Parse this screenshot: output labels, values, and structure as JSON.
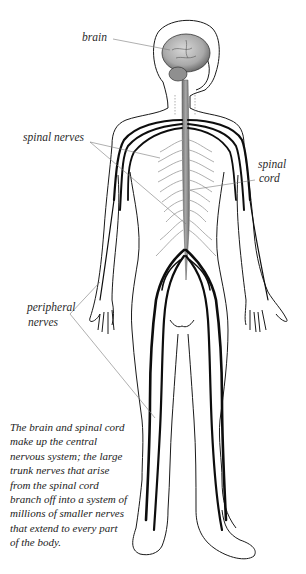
{
  "labels": {
    "brain": "brain",
    "spinal_nerves": "spinal nerves",
    "spinal_cord_line1": "spinal",
    "spinal_cord_line2": "cord",
    "peripheral_line1": "peripheral",
    "peripheral_line2": "nerves"
  },
  "caption": {
    "lines": [
      "The brain and spinal cord",
      "make up the central",
      "nervous system; the large",
      "trunk nerves that arise",
      "from the spinal cord",
      "branch off into a system of",
      "millions of smaller nerves",
      "that extend to every part",
      "of the body."
    ]
  },
  "colors": {
    "outline": "#1a1a1a",
    "nerve": "#0d0d0d",
    "spinal_cord": "#8a8a8a",
    "brain": "#b9b9b9",
    "leader_line": "#7a7a7a",
    "rib_nerves": "#9a9a9a"
  }
}
